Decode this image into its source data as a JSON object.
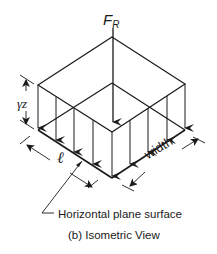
{
  "diagram": {
    "resultant_force_label": "F",
    "resultant_force_subscript": "R",
    "pressure_label": "γz",
    "length_label": "ℓ",
    "width_label": "width",
    "surface_callout": "Horizontal plane surface",
    "caption": "(b) Isometric View",
    "colors": {
      "line": "#1a1a1a",
      "background": "#ffffff"
    }
  }
}
